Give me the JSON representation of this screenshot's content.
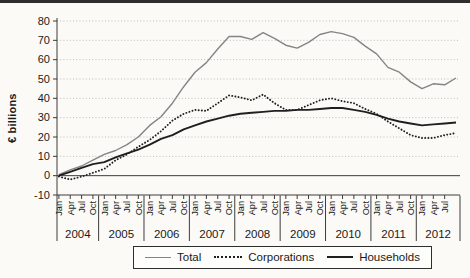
{
  "figure": {
    "background_color": "#fbfaf7",
    "top_rule_color": "#2e2e2e"
  },
  "chart_data": {
    "type": "line",
    "title": "",
    "ylabel": "€ billions",
    "xlabel": "",
    "ylim": [
      -10,
      80
    ],
    "y_ticks": [
      80,
      70,
      60,
      50,
      40,
      30,
      20,
      10,
      0,
      -10
    ],
    "grid": "dotted horizontal gridlines at each 10, solid line at 0",
    "legend_position": "bottom-center boxed",
    "x_axis": {
      "unit": "months, quarterly ticks",
      "years": [
        {
          "label": "2004",
          "quarter_ticks": [
            "Jan",
            "Apr",
            "Jul",
            "Oct"
          ]
        },
        {
          "label": "2005",
          "quarter_ticks": [
            "Jan",
            "Apr",
            "Jul",
            "Oct"
          ]
        },
        {
          "label": "2006",
          "quarter_ticks": [
            "Jan",
            "Apr",
            "Jul",
            "Oct"
          ]
        },
        {
          "label": "2007",
          "quarter_ticks": [
            "Jan",
            "Apr",
            "Jul",
            "Oct"
          ]
        },
        {
          "label": "2008",
          "quarter_ticks": [
            "Jan",
            "Apr",
            "Jul",
            "Oct"
          ]
        },
        {
          "label": "2009",
          "quarter_ticks": [
            "Jan",
            "Apr",
            "Jul",
            "Oct"
          ]
        },
        {
          "label": "2010",
          "quarter_ticks": [
            "Jan",
            "Apr",
            "Jul",
            "Oct"
          ]
        },
        {
          "label": "2011",
          "quarter_ticks": [
            "Jan",
            "Apr",
            "Jul",
            "Oct"
          ]
        },
        {
          "label": "2012",
          "quarter_ticks": [
            "Jan",
            "Apr",
            "Jul"
          ]
        }
      ],
      "note": "series values are quarterly estimates from Jan 2004 through Jul 2012 plus one trailing end-of-series point (~Aug 2012)"
    },
    "series": [
      {
        "name": "Total",
        "style": "solid-thin",
        "color": "#848484",
        "values": [
          0.5,
          3,
          5,
          8,
          11,
          13,
          16,
          20,
          26,
          30.5,
          37.5,
          46,
          53.5,
          58.5,
          65.5,
          72,
          72,
          70.5,
          74,
          71,
          67.5,
          66,
          69,
          73,
          74.5,
          73.5,
          71.5,
          67,
          63,
          56,
          53.5,
          48.5,
          45,
          47.5,
          47,
          50.5
        ]
      },
      {
        "name": "Corporations",
        "style": "dotted",
        "color": "#1f1f1f",
        "values": [
          -0.5,
          -2,
          -0.5,
          1.5,
          3.5,
          8,
          11,
          15,
          18.5,
          23,
          28.5,
          32,
          34,
          33.5,
          37.5,
          41.5,
          40.5,
          39,
          42,
          37.5,
          34,
          34,
          36.5,
          39,
          40,
          38.5,
          37.5,
          34.5,
          32,
          28,
          24.5,
          21,
          19.5,
          19.5,
          21,
          22
        ]
      },
      {
        "name": "Households",
        "style": "solid-thick",
        "color": "#1f1f1f",
        "values": [
          0,
          2,
          4,
          6,
          7,
          9.5,
          11.5,
          13.5,
          16,
          19,
          21,
          24,
          26,
          28,
          29.5,
          31,
          32,
          32.5,
          33,
          33.5,
          33.5,
          34,
          34,
          34.5,
          35,
          35,
          34,
          33,
          31.5,
          29.5,
          28,
          27,
          26,
          26.5,
          27,
          27.5
        ]
      }
    ]
  },
  "legend": {
    "items": [
      "Total",
      "Corporations",
      "Households"
    ]
  }
}
